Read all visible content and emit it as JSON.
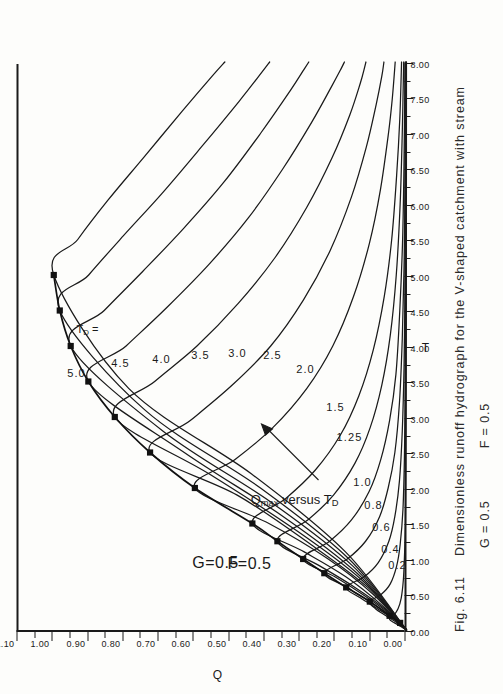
{
  "figure": {
    "number": "Fig. 6.11",
    "caption_main": "Dimensionless runoff hydrograph for the V-shaped catchment with stream",
    "caption_params": {
      "g": "G = 0.5",
      "f": "F = 0.5"
    }
  },
  "annotations": {
    "param_g": "G=0.5",
    "param_f": "F=0.5",
    "td_legend": "T",
    "td_legend_sub": "D",
    "td_legend_eq": " =",
    "qmax_prefix": "Q",
    "qmax_sub": "max",
    "qmax_rest": " versus T",
    "qmax_rest_sub": "D"
  },
  "chart_data": {
    "type": "line",
    "title": "Dimensionless runoff hydrograph for the V-shaped catchment with stream",
    "xlabel": "T",
    "ylabel": "Q",
    "xlim": [
      0,
      8
    ],
    "ylim": [
      0,
      1.1
    ],
    "grid": false,
    "legend": "inline-curve-labels",
    "orientation_note": "figure printed rotated 90 degrees counter-clockwise on page",
    "xticks": [
      "0.00",
      "0.50",
      "1.00",
      "1.50",
      "2.00",
      "2.50",
      "3.00",
      "3.50",
      "4.00",
      "4.50",
      "5.00",
      "5.50",
      "6.00",
      "6.50",
      "7.00",
      "7.50",
      "8.00"
    ],
    "yticks": [
      "0.00",
      "0.10",
      "0.20",
      "0.30",
      "0.40",
      "0.50",
      "0.60",
      "0.70",
      "0.80",
      "0.90",
      "1.00",
      "1.10"
    ],
    "xtick_values": [
      0,
      0.5,
      1,
      1.5,
      2,
      2.5,
      3,
      3.5,
      4,
      4.5,
      5,
      5.5,
      6,
      6.5,
      7,
      7.5,
      8
    ],
    "ytick_values": [
      0,
      0.1,
      0.2,
      0.3,
      0.4,
      0.5,
      0.6,
      0.7,
      0.8,
      0.9,
      1.0,
      1.1
    ],
    "series": [
      {
        "name": "0.2",
        "label": "0.2",
        "td": 0.2,
        "x": [
          0,
          0.05,
          0.1,
          0.15,
          0.2,
          0.3,
          0.45,
          0.7,
          1.0,
          1.5,
          2.2,
          3.2,
          4.5,
          6.0,
          8.0
        ],
        "y": [
          0,
          0.016,
          0.034,
          0.048,
          0.037,
          0.024,
          0.015,
          0.009,
          0.006,
          0.003,
          0.0018,
          0.001,
          0.0006,
          0.0003,
          0.0001
        ]
      },
      {
        "name": "0.4",
        "label": "0.4",
        "td": 0.4,
        "x": [
          0,
          0.1,
          0.2,
          0.3,
          0.4,
          0.5,
          0.65,
          0.9,
          1.2,
          1.7,
          2.4,
          3.4,
          4.6,
          6.0,
          8.0
        ],
        "y": [
          0,
          0.026,
          0.058,
          0.088,
          0.104,
          0.072,
          0.046,
          0.028,
          0.018,
          0.01,
          0.006,
          0.003,
          0.0017,
          0.0009,
          0.0004
        ]
      },
      {
        "name": "0.6",
        "label": "0.6",
        "td": 0.6,
        "x": [
          0,
          0.15,
          0.3,
          0.45,
          0.6,
          0.75,
          0.95,
          1.25,
          1.6,
          2.1,
          2.8,
          3.7,
          4.8,
          6.1,
          8.0
        ],
        "y": [
          0,
          0.036,
          0.082,
          0.13,
          0.171,
          0.12,
          0.08,
          0.05,
          0.033,
          0.02,
          0.012,
          0.007,
          0.004,
          0.002,
          0.001
        ]
      },
      {
        "name": "0.8",
        "label": "0.8",
        "td": 0.8,
        "x": [
          0,
          0.2,
          0.4,
          0.6,
          0.8,
          1.0,
          1.25,
          1.6,
          2.0,
          2.5,
          3.2,
          4.1,
          5.1,
          6.3,
          8.0
        ],
        "y": [
          0,
          0.045,
          0.104,
          0.168,
          0.233,
          0.168,
          0.116,
          0.076,
          0.052,
          0.033,
          0.02,
          0.012,
          0.007,
          0.004,
          0.002
        ]
      },
      {
        "name": "1.0",
        "label": "1.0",
        "td": 1.0,
        "x": [
          0,
          0.25,
          0.5,
          0.75,
          1.0,
          1.25,
          1.55,
          1.95,
          2.4,
          2.95,
          3.6,
          4.5,
          5.5,
          6.6,
          8.0
        ],
        "y": [
          0,
          0.054,
          0.124,
          0.203,
          0.293,
          0.218,
          0.156,
          0.106,
          0.073,
          0.048,
          0.03,
          0.019,
          0.011,
          0.007,
          0.004
        ]
      },
      {
        "name": "1.25",
        "label": "1.25",
        "td": 1.25,
        "x": [
          0,
          0.3,
          0.6,
          0.9,
          1.25,
          1.55,
          1.9,
          2.35,
          2.85,
          3.45,
          4.15,
          5.0,
          6.0,
          7.0,
          8.0
        ],
        "y": [
          0,
          0.062,
          0.146,
          0.245,
          0.366,
          0.28,
          0.207,
          0.146,
          0.103,
          0.07,
          0.046,
          0.029,
          0.018,
          0.012,
          0.008
        ]
      },
      {
        "name": "1.5",
        "label": "1.5",
        "td": 1.5,
        "x": [
          0,
          0.35,
          0.75,
          1.1,
          1.5,
          1.85,
          2.25,
          2.75,
          3.3,
          3.95,
          4.7,
          5.5,
          6.4,
          7.2,
          8.0
        ],
        "y": [
          0,
          0.07,
          0.172,
          0.29,
          0.437,
          0.343,
          0.259,
          0.187,
          0.135,
          0.094,
          0.063,
          0.042,
          0.028,
          0.019,
          0.014
        ]
      },
      {
        "name": "2.0",
        "label": "2.0",
        "td": 2.0,
        "x": [
          0,
          0.5,
          1.0,
          1.5,
          2.0,
          2.4,
          2.85,
          3.4,
          4.0,
          4.7,
          5.45,
          6.2,
          7.0,
          7.5,
          8.0
        ],
        "y": [
          0,
          0.094,
          0.222,
          0.39,
          0.6,
          0.486,
          0.379,
          0.283,
          0.209,
          0.15,
          0.105,
          0.074,
          0.051,
          0.04,
          0.032
        ]
      },
      {
        "name": "2.5",
        "label": "2.5",
        "td": 2.5,
        "x": [
          0,
          0.6,
          1.2,
          1.9,
          2.5,
          2.95,
          3.45,
          4.0,
          4.65,
          5.35,
          6.1,
          6.8,
          7.4,
          7.8,
          8.0
        ],
        "y": [
          0,
          0.11,
          0.27,
          0.48,
          0.727,
          0.613,
          0.494,
          0.385,
          0.292,
          0.216,
          0.156,
          0.114,
          0.086,
          0.07,
          0.064
        ]
      },
      {
        "name": "3.0",
        "label": "3.0",
        "td": 3.0,
        "x": [
          0,
          0.7,
          1.4,
          2.2,
          3.0,
          3.5,
          4.0,
          4.6,
          5.25,
          5.95,
          6.65,
          7.25,
          7.7,
          7.9,
          8.0
        ],
        "y": [
          0,
          0.126,
          0.312,
          0.56,
          0.827,
          0.714,
          0.594,
          0.477,
          0.372,
          0.283,
          0.211,
          0.161,
          0.131,
          0.12,
          0.115
        ]
      },
      {
        "name": "3.5",
        "label": "3.5",
        "td": 3.5,
        "x": [
          0,
          0.8,
          1.6,
          2.5,
          3.5,
          4.0,
          4.55,
          5.15,
          5.8,
          6.5,
          7.15,
          7.65,
          7.9,
          8.0
        ],
        "y": [
          0,
          0.14,
          0.35,
          0.63,
          0.902,
          0.795,
          0.678,
          0.56,
          0.449,
          0.35,
          0.269,
          0.213,
          0.186,
          0.176
        ]
      },
      {
        "name": "4.0",
        "label": "4.0",
        "td": 4.0,
        "x": [
          0,
          0.9,
          1.8,
          2.8,
          4.0,
          4.5,
          5.05,
          5.65,
          6.3,
          7.0,
          7.6,
          7.9,
          8.0
        ],
        "y": [
          0,
          0.152,
          0.384,
          0.69,
          0.952,
          0.857,
          0.748,
          0.633,
          0.519,
          0.413,
          0.329,
          0.29,
          0.277
        ]
      },
      {
        "name": "4.5",
        "label": "4.5",
        "td": 4.5,
        "x": [
          0,
          1.0,
          2.0,
          3.1,
          4.5,
          5.0,
          5.55,
          6.15,
          6.8,
          7.45,
          7.85,
          8.0
        ],
        "y": [
          0,
          0.163,
          0.414,
          0.742,
          0.983,
          0.901,
          0.803,
          0.693,
          0.582,
          0.474,
          0.411,
          0.388
        ]
      },
      {
        "name": "5.0",
        "label": "5.0",
        "td": 5.0,
        "x": [
          0,
          1.1,
          2.2,
          3.4,
          5.0,
          5.5,
          6.05,
          6.65,
          7.3,
          7.8,
          8.0
        ],
        "y": [
          0,
          0.173,
          0.44,
          0.787,
          1.0,
          0.932,
          0.847,
          0.746,
          0.637,
          0.551,
          0.515
        ]
      }
    ],
    "envelope": {
      "name": "Qmax versus TD",
      "label": "Q_max versus T_D",
      "x": [
        0.1,
        0.2,
        0.4,
        0.6,
        0.8,
        1.0,
        1.25,
        1.5,
        2.0,
        2.5,
        3.0,
        3.5,
        4.0,
        4.5,
        5.0
      ],
      "y": [
        0.018,
        0.048,
        0.104,
        0.171,
        0.233,
        0.293,
        0.366,
        0.437,
        0.6,
        0.727,
        0.827,
        0.902,
        0.952,
        0.983,
        1.0
      ],
      "marker": "filled-square"
    },
    "curve_label_order": [
      "5.0",
      "4.5",
      "4.0",
      "3.5",
      "3.0",
      "2.5",
      "2.0",
      "1.5",
      "1.25",
      "1.0",
      "0.8",
      "0.6",
      "0.4",
      "0.2"
    ]
  }
}
